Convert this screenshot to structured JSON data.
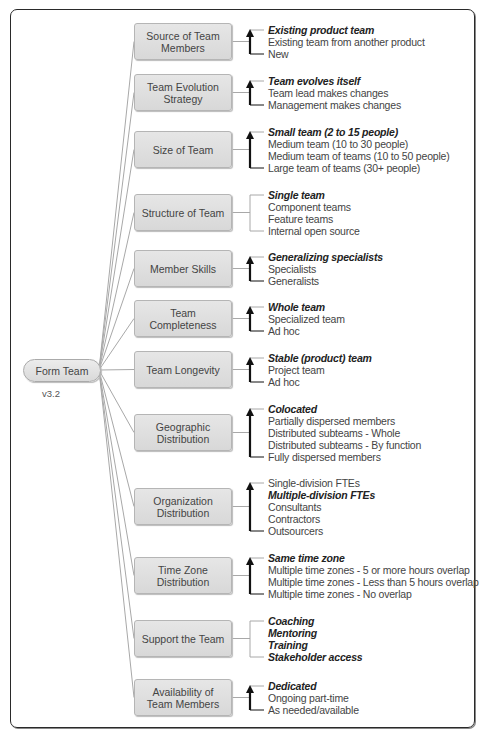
{
  "root": {
    "label": "Form Team",
    "version": "v3.2"
  },
  "categories": [
    {
      "label": "Source of Team Members",
      "top": 23,
      "arrow": true,
      "options": [
        {
          "text": "Existing product team",
          "selected": true
        },
        {
          "text": "Existing team from another product",
          "selected": false
        },
        {
          "text": "New",
          "selected": false
        }
      ]
    },
    {
      "label": "Team Evolution Strategy",
      "top": 74,
      "arrow": true,
      "options": [
        {
          "text": "Team evolves itself",
          "selected": true
        },
        {
          "text": "Team lead makes changes",
          "selected": false
        },
        {
          "text": "Management makes changes",
          "selected": false
        }
      ]
    },
    {
      "label": "Size of Team",
      "top": 131,
      "arrow": true,
      "options": [
        {
          "text": "Small team (2 to 15 people)",
          "selected": true
        },
        {
          "text": "Medium team (10 to 30 people)",
          "selected": false
        },
        {
          "text": "Medium team of teams (10 to 50 people)",
          "selected": false
        },
        {
          "text": "Large team of teams (30+ people)",
          "selected": false
        }
      ]
    },
    {
      "label": "Structure of Team",
      "top": 194,
      "arrow": false,
      "options": [
        {
          "text": "Single team",
          "selected": true
        },
        {
          "text": "Component teams",
          "selected": false
        },
        {
          "text": "Feature teams",
          "selected": false
        },
        {
          "text": "Internal open source",
          "selected": false
        }
      ]
    },
    {
      "label": "Member Skills",
      "top": 250,
      "arrow": true,
      "options": [
        {
          "text": "Generalizing specialists",
          "selected": true
        },
        {
          "text": "Specialists",
          "selected": false
        },
        {
          "text": "Generalists",
          "selected": false
        }
      ]
    },
    {
      "label": "Team Completeness",
      "top": 300,
      "arrow": true,
      "options": [
        {
          "text": "Whole team",
          "selected": true
        },
        {
          "text": "Specialized team",
          "selected": false
        },
        {
          "text": "Ad hoc",
          "selected": false
        }
      ]
    },
    {
      "label": "Team Longevity",
      "top": 351,
      "arrow": true,
      "options": [
        {
          "text": "Stable (product) team",
          "selected": true
        },
        {
          "text": "Project team",
          "selected": false
        },
        {
          "text": "Ad hoc",
          "selected": false
        }
      ]
    },
    {
      "label": "Geographic Distribution",
      "top": 414,
      "arrow": true,
      "options": [
        {
          "text": "Colocated",
          "selected": true
        },
        {
          "text": "Partially dispersed members",
          "selected": false
        },
        {
          "text": "Distributed subteams - Whole",
          "selected": false
        },
        {
          "text": "Distributed subteams - By function",
          "selected": false
        },
        {
          "text": "Fully dispersed members",
          "selected": false
        }
      ]
    },
    {
      "label": "Organization Distribution",
      "top": 488,
      "arrow": true,
      "options": [
        {
          "text": "Single-division FTEs",
          "selected": false
        },
        {
          "text": "Multiple-division FTEs",
          "selected": true
        },
        {
          "text": "Consultants",
          "selected": false
        },
        {
          "text": "Contractors",
          "selected": false
        },
        {
          "text": "Outsourcers",
          "selected": false
        }
      ]
    },
    {
      "label": "Time Zone Distribution",
      "top": 557,
      "arrow": true,
      "options": [
        {
          "text": "Same time zone",
          "selected": true
        },
        {
          "text": "Multiple time zones - 5 or more hours overlap",
          "selected": false
        },
        {
          "text": "Multiple time zones - Less than 5 hours overlap",
          "selected": false
        },
        {
          "text": "Multiple time zones - No overlap",
          "selected": false
        }
      ]
    },
    {
      "label": "Support the Team",
      "top": 620,
      "arrow": false,
      "options": [
        {
          "text": "Coaching",
          "selected": true
        },
        {
          "text": "Mentoring",
          "selected": true
        },
        {
          "text": "Training",
          "selected": true
        },
        {
          "text": "Stakeholder access",
          "selected": true
        }
      ]
    },
    {
      "label": "Availability of Team Members",
      "top": 679,
      "arrow": true,
      "options": [
        {
          "text": "Dedicated",
          "selected": true
        },
        {
          "text": "Ongoing part-time",
          "selected": false
        },
        {
          "text": "As needed/available",
          "selected": false
        }
      ]
    }
  ],
  "colors": {
    "frame": "#2a2a2a",
    "box_fill": "#dedede",
    "box_border": "#b5b5b5",
    "connector": "#a8a8a8",
    "arrow": "#111111",
    "text": "#444444"
  }
}
